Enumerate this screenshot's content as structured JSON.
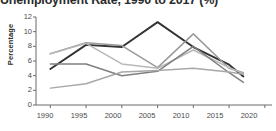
{
  "chart_data": {
    "type": "line",
    "title": "Unemployment Rate, 1990 to 2017 (%)",
    "xlabel": "",
    "ylabel": "Percentage",
    "xlim": [
      1988,
      2021
    ],
    "ylim": [
      0,
      12
    ],
    "grid": false,
    "legend": "none",
    "x_ticks": [
      "1990",
      "1995",
      "2000",
      "2005",
      "2010",
      "2015",
      "2020"
    ],
    "y_ticks": [
      "0",
      "2",
      "4",
      "6",
      "8",
      "10",
      "12"
    ],
    "x": [
      1990,
      1995,
      2000,
      2005,
      2010,
      2015,
      2017
    ],
    "series": [
      {
        "name": "Series 1",
        "color": "#333333",
        "width": 1.9,
        "values": [
          4.9,
          8.2,
          7.9,
          11.3,
          7.9,
          5.5,
          3.9
        ]
      },
      {
        "name": "Series 2",
        "color": "#9a9a9a",
        "width": 1.5,
        "values": [
          7.0,
          8.5,
          8.1,
          5.1,
          9.7,
          5.0,
          4.4
        ]
      },
      {
        "name": "Series 3",
        "color": "#b8b8b8",
        "width": 1.5,
        "values": [
          7.0,
          8.4,
          5.6,
          5.0,
          7.5,
          5.1,
          4.3
        ]
      },
      {
        "name": "Series 4",
        "color": "#808080",
        "width": 1.5,
        "values": [
          5.6,
          5.6,
          4.0,
          4.6,
          8.0,
          4.4,
          3.1
        ]
      },
      {
        "name": "Series 5",
        "color": "#a8a8a8",
        "width": 1.5,
        "values": [
          2.3,
          2.9,
          4.5,
          4.7,
          5.0,
          4.5,
          4.2
        ]
      }
    ],
    "axis_color": "#6b6b6b"
  }
}
